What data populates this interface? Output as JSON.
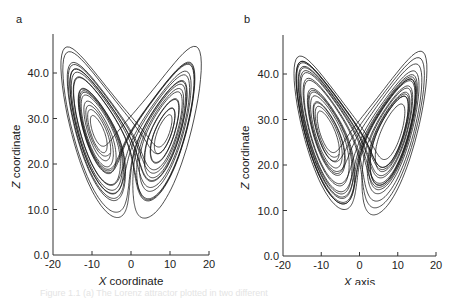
{
  "figure": {
    "caption_faint": "Figure 1.1  (a) The Lorenz attractor plotted in two different"
  },
  "chart_data": [
    {
      "type": "line",
      "panel_label": "a",
      "title": "",
      "xlabel": "X coordinate",
      "ylabel": "Z coordinate",
      "xlim": [
        -20,
        20
      ],
      "ylim": [
        0,
        45
      ],
      "x_ticks": [
        -20,
        -10,
        0,
        10,
        20
      ],
      "x_tick_labels": [
        "-20",
        "-10",
        "0",
        "10",
        "20"
      ],
      "y_ticks": [
        0,
        10,
        20,
        30,
        40
      ],
      "y_tick_labels": [
        "0.0",
        "10.0",
        "20.0",
        "30.0",
        "40.0"
      ],
      "grid": false,
      "legend": null,
      "series": [
        {
          "name": "Lorenz attractor trajectory (X vs Z)",
          "description": "butterfly-shaped trajectory; two lobes centered near x=-8.5,z=27 and x=8.5,z=27; z range approx 7 to 43; x range approx -18 to 18",
          "x_range": [
            -18,
            18
          ],
          "z_range": [
            7,
            43
          ]
        }
      ]
    },
    {
      "type": "line",
      "panel_label": "b",
      "title": "",
      "xlabel": "X axis",
      "ylabel": "Z coordinate",
      "xlim": [
        -20,
        20
      ],
      "ylim": [
        0,
        45
      ],
      "x_ticks": [
        -20,
        -10,
        0,
        10,
        20
      ],
      "x_tick_labels": [
        "-20",
        "-10",
        "0",
        "10",
        "20"
      ],
      "y_ticks": [
        0,
        10,
        20,
        30,
        40
      ],
      "y_tick_labels": [
        "0.0",
        "10.0",
        "20.0",
        "30.0",
        "40.0"
      ],
      "grid": false,
      "legend": null,
      "series": [
        {
          "name": "Lorenz attractor trajectory (X vs Z)",
          "description": "butterfly-shaped trajectory, slightly different initial conditions; z range approx 7 to 43; x range approx -18 to 18",
          "x_range": [
            -18,
            18
          ],
          "z_range": [
            7,
            43
          ]
        }
      ]
    }
  ]
}
